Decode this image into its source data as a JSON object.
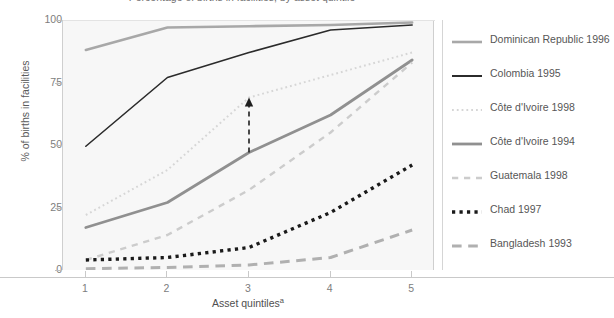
{
  "chart_data": {
    "type": "line",
    "title": "Percentage of births in facilities, by asset quintile",
    "xlabel": "Asset quintiles",
    "xlabel_superscript": "a",
    "ylabel": "% of births in facilities",
    "categories": [
      "1",
      "2",
      "3",
      "4",
      "5"
    ],
    "x": [
      1,
      2,
      3,
      4,
      5
    ],
    "xlim": [
      0.72,
      5.28
    ],
    "ylim": [
      0,
      100
    ],
    "yticks": [
      0,
      25,
      50,
      75,
      100
    ],
    "ytick_labels": [
      "0",
      "25",
      "50",
      "75",
      "100"
    ],
    "grid": false,
    "legend_position": "right",
    "series": [
      {
        "name": "Dominican Republic 1996",
        "values": [
          88,
          97,
          97.5,
          98,
          99
        ],
        "color": "#a8a8a8",
        "style": "solid",
        "width": 2.6
      },
      {
        "name": "Colombia 1995",
        "values": [
          49.5,
          77,
          87,
          96,
          98
        ],
        "color": "#2b2b2b",
        "style": "solid",
        "width": 1.6
      },
      {
        "name": "Côte d'Ivoire 1998",
        "values": [
          22,
          40,
          69,
          78,
          87
        ],
        "color": "#d6d6d6",
        "style": "dotted",
        "width": 2.0
      },
      {
        "name": "Côte d'Ivoire 1994",
        "values": [
          17,
          27,
          47,
          62,
          84
        ],
        "color": "#909090",
        "style": "solid",
        "width": 2.8
      },
      {
        "name": "Guatemala 1998",
        "values": [
          4,
          14,
          32,
          55,
          83
        ],
        "color": "#cccccc",
        "style": "dashed",
        "width": 2.4
      },
      {
        "name": "Chad 1997",
        "values": [
          4,
          5,
          9,
          23,
          42
        ],
        "color": "#1a1a1a",
        "style": "dotted-thick",
        "width": 3.4
      },
      {
        "name": "Bangladesh 1993",
        "values": [
          0.5,
          1,
          2,
          5,
          16
        ],
        "color": "#b0b0b0",
        "style": "long-dash",
        "width": 3.0
      }
    ],
    "annotations": [
      {
        "type": "arrow",
        "name": "improvement-arrow",
        "x": 3,
        "y_start": 47,
        "y_end": 69,
        "style": "dashed",
        "color": "#1f1f1f",
        "head": "up"
      }
    ]
  },
  "legend": {
    "items": [
      {
        "label": "Dominican Republic 1996"
      },
      {
        "label": "Colombia 1995"
      },
      {
        "label": "Côte d'Ivoire 1998"
      },
      {
        "label": "Côte d'Ivoire 1994"
      },
      {
        "label": "Guatemala 1998"
      },
      {
        "label": "Chad 1997"
      },
      {
        "label": "Bangladesh 1993"
      }
    ]
  }
}
